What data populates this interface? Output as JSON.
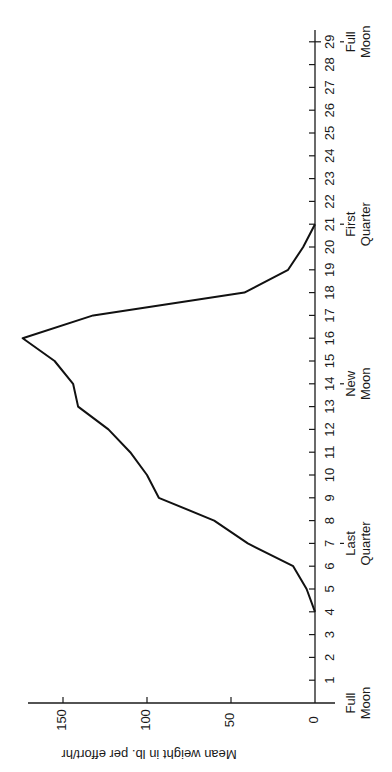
{
  "chart_data": {
    "type": "line",
    "orientation": "rotated-90-ccw",
    "title": "",
    "xlabel": "",
    "ylabel": "Mean weight in lb. per effort/hr",
    "x": [
      4,
      5,
      6,
      7,
      8,
      9,
      10,
      11,
      12,
      13,
      14,
      15,
      16,
      17,
      18,
      19,
      20,
      21
    ],
    "series": [
      {
        "name": "Mean weight",
        "values": [
          0,
          5,
          13,
          40,
          60,
          93,
          100,
          110,
          123,
          141,
          144,
          155,
          174,
          132,
          42,
          16,
          7,
          0
        ]
      }
    ],
    "x_ticks": [
      0,
      1,
      2,
      3,
      4,
      5,
      6,
      7,
      8,
      9,
      10,
      11,
      12,
      13,
      14,
      15,
      16,
      17,
      18,
      19,
      20,
      21,
      22,
      23,
      24,
      25,
      26,
      27,
      28,
      29
    ],
    "y_ticks": [
      0,
      50,
      100,
      150
    ],
    "xlim": [
      0,
      29
    ],
    "ylim": [
      0,
      180
    ],
    "grid": false,
    "legend": "none",
    "annotations": [
      {
        "day": 0,
        "lines": [
          "Full",
          "Moon"
        ],
        "marker": false
      },
      {
        "day": 7,
        "lines": [
          "Last",
          "Quarter"
        ],
        "marker": true
      },
      {
        "day": 14,
        "lines": [
          "New",
          "Moon"
        ],
        "marker": true
      },
      {
        "day": 21,
        "lines": [
          "First",
          "Quarter"
        ],
        "marker": true
      },
      {
        "day": 29,
        "lines": [
          "Full",
          "Moon"
        ],
        "marker": true
      }
    ]
  },
  "layout": {
    "day0_y": 703,
    "px_per_day": 22.8,
    "value0_x": 315,
    "px_per_unit": 1.68,
    "axis_top_y": 30,
    "value_axis_left_x": 28,
    "value_axis_right_x": 335,
    "colors": {
      "line": "#111111",
      "axis": "#1a1a1a",
      "background": "#ffffff"
    }
  }
}
